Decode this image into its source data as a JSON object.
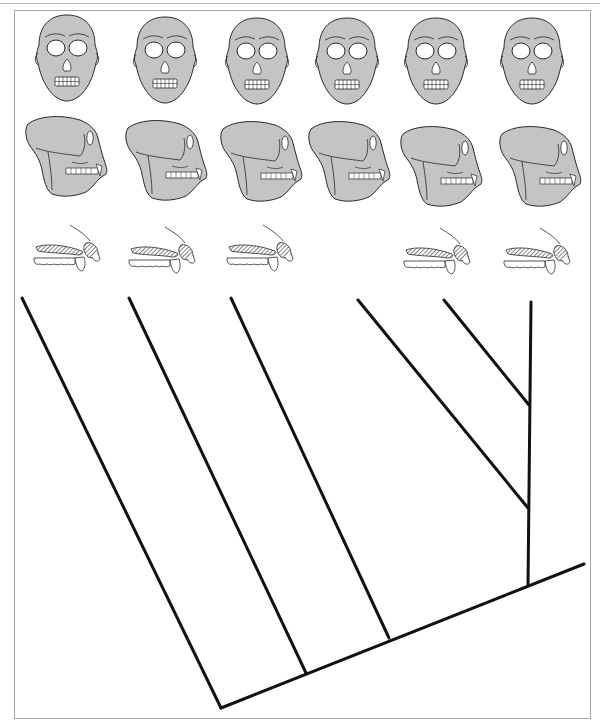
{
  "figure": {
    "type": "cladogram",
    "columns": 6,
    "rows": [
      {
        "name": "frontal-skull-views",
        "count": 6
      },
      {
        "name": "lateral-skull-views",
        "count": 6
      },
      {
        "name": "dental-profiles",
        "count": 5,
        "missing_column": 4
      }
    ],
    "colors": {
      "skull_fill": "#c4c4c4",
      "skull_fill_dark": "#b8b8b8",
      "outline": "#2a2a2a",
      "tree_line": "#111111",
      "frame": "#a8a8a8",
      "background": "#ffffff"
    },
    "tree": {
      "stroke_width": 3,
      "branches": [
        {
          "id": "branch-1",
          "x1": 22,
          "y1": 298,
          "x2": 221,
          "y2": 708
        },
        {
          "id": "branch-2",
          "x1": 129,
          "y1": 298,
          "x2": 306,
          "y2": 673
        },
        {
          "id": "branch-3",
          "x1": 231,
          "y1": 298,
          "x2": 389,
          "y2": 638
        },
        {
          "id": "branch-4",
          "x1": 358,
          "y1": 300,
          "x2": 528,
          "y2": 508
        },
        {
          "id": "branch-5",
          "x1": 444,
          "y1": 300,
          "x2": 529,
          "y2": 405
        },
        {
          "id": "stem",
          "x1": 531,
          "y1": 302,
          "x2": 528,
          "y2": 586
        },
        {
          "id": "base",
          "x1": 221,
          "y1": 708,
          "x2": 584,
          "y2": 564
        }
      ]
    }
  }
}
